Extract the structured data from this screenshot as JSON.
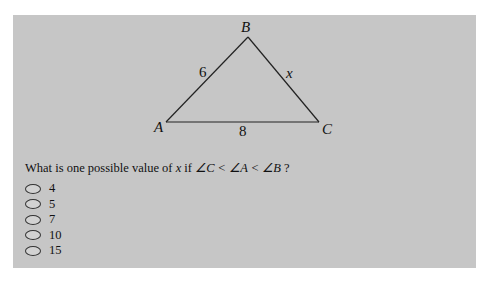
{
  "figure": {
    "vertices": {
      "A": "A",
      "B": "B",
      "C": "C"
    },
    "sides": {
      "AB": "6",
      "BC": "x",
      "AC": "8"
    }
  },
  "question": {
    "prefix": "What is one possible value of ",
    "variable": "x",
    "middle": " if ",
    "condition": "∠C < ∠A < ∠B",
    "suffix": " ?"
  },
  "options": [
    {
      "label": "4",
      "selected": false
    },
    {
      "label": "5",
      "selected": false
    },
    {
      "label": "7",
      "selected": false
    },
    {
      "label": "10",
      "selected": false
    },
    {
      "label": "15",
      "selected": false
    }
  ]
}
